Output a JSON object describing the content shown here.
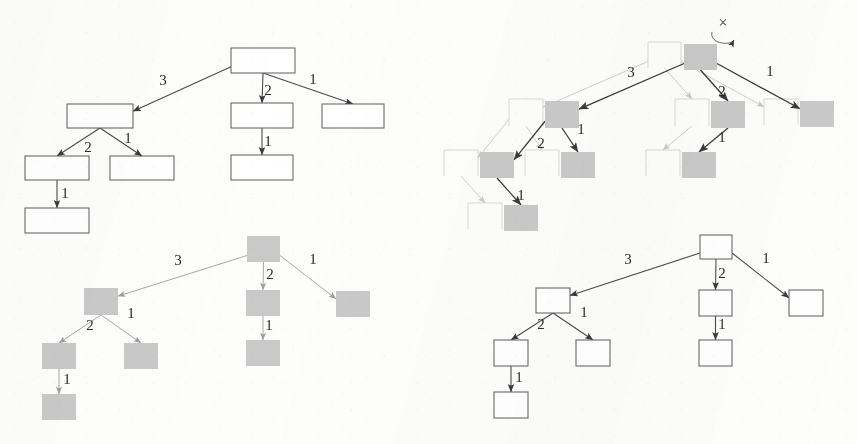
{
  "figure": {
    "kind": "tree-diagram-figure",
    "panel_count": 4,
    "background_color": "#fdfdfb",
    "outline_color": "#5d5d5d",
    "fill_gray": "#c9c9c9",
    "edge_color": "#4a4a4a"
  },
  "panels": [
    {
      "id": "top-left",
      "name": "panel-top-left",
      "style": "outline",
      "nodes": [
        {
          "id": "n0",
          "label": "",
          "x": 231,
          "y": 48,
          "w": 64,
          "h": 25,
          "fill": "outline"
        },
        {
          "id": "n1",
          "label": "",
          "x": 67,
          "y": 104,
          "w": 66,
          "h": 24,
          "fill": "outline"
        },
        {
          "id": "n2",
          "label": "",
          "x": 231,
          "y": 103,
          "w": 62,
          "h": 25,
          "fill": "outline"
        },
        {
          "id": "n3",
          "label": "",
          "x": 322,
          "y": 104,
          "w": 62,
          "h": 24,
          "fill": "outline"
        },
        {
          "id": "n4",
          "label": "",
          "x": 25,
          "y": 156,
          "w": 64,
          "h": 24,
          "fill": "outline"
        },
        {
          "id": "n5",
          "label": "",
          "x": 110,
          "y": 156,
          "w": 64,
          "h": 24,
          "fill": "outline"
        },
        {
          "id": "n6",
          "label": "",
          "x": 231,
          "y": 155,
          "w": 62,
          "h": 25,
          "fill": "outline"
        },
        {
          "id": "n7",
          "label": "",
          "x": 25,
          "y": 208,
          "w": 64,
          "h": 25,
          "fill": "outline"
        }
      ],
      "edges": [
        {
          "from": "n0",
          "to": "n1",
          "label": "3",
          "lx": 163,
          "ly": 85
        },
        {
          "from": "n0",
          "to": "n2",
          "label": "2",
          "lx": 268,
          "ly": 95
        },
        {
          "from": "n0",
          "to": "n3",
          "label": "1",
          "lx": 313,
          "ly": 84
        },
        {
          "from": "n1",
          "to": "n4",
          "label": "2",
          "lx": 88,
          "ly": 152
        },
        {
          "from": "n1",
          "to": "n5",
          "label": "1",
          "lx": 128,
          "ly": 143
        },
        {
          "from": "n2",
          "to": "n6",
          "label": "1",
          "lx": 268,
          "ly": 146
        },
        {
          "from": "n4",
          "to": "n7",
          "label": "1",
          "lx": 65,
          "ly": 198
        }
      ]
    },
    {
      "id": "top-right",
      "name": "panel-top-right",
      "style": "overlay-ghost-and-gray",
      "annotation": {
        "symbol": "×",
        "name": "cross-mark",
        "x": 723,
        "y": 28
      },
      "nodes": [
        {
          "id": "g0",
          "label": "",
          "x": 684,
          "y": 44,
          "w": 33,
          "h": 26,
          "fill": "gray"
        },
        {
          "id": "g1",
          "label": "",
          "x": 545,
          "y": 101,
          "w": 34,
          "h": 27,
          "fill": "gray"
        },
        {
          "id": "g2",
          "label": "",
          "x": 711,
          "y": 101,
          "w": 34,
          "h": 27,
          "fill": "gray"
        },
        {
          "id": "g3",
          "label": "",
          "x": 800,
          "y": 101,
          "w": 34,
          "h": 26,
          "fill": "gray"
        },
        {
          "id": "g4",
          "label": "",
          "x": 480,
          "y": 152,
          "w": 34,
          "h": 26,
          "fill": "gray"
        },
        {
          "id": "g5",
          "label": "",
          "x": 561,
          "y": 152,
          "w": 34,
          "h": 26,
          "fill": "gray"
        },
        {
          "id": "g6",
          "label": "",
          "x": 682,
          "y": 152,
          "w": 34,
          "h": 26,
          "fill": "gray"
        },
        {
          "id": "g7",
          "label": "",
          "x": 504,
          "y": 205,
          "w": 34,
          "h": 26,
          "fill": "gray"
        }
      ],
      "edges": [
        {
          "from": "g0",
          "to": "g1",
          "label": "3",
          "lx": 631,
          "ly": 77
        },
        {
          "from": "g0",
          "to": "g2",
          "label": "2",
          "lx": 722,
          "ly": 96
        },
        {
          "from": "g0",
          "to": "g3",
          "label": "1",
          "lx": 770,
          "ly": 76
        },
        {
          "from": "g1",
          "to": "g4",
          "label": "2",
          "lx": 541,
          "ly": 148
        },
        {
          "from": "g1",
          "to": "g5",
          "label": "1",
          "lx": 581,
          "ly": 134
        },
        {
          "from": "g2",
          "to": "g6",
          "label": "1",
          "lx": 722,
          "ly": 142
        },
        {
          "from": "g4",
          "to": "g7",
          "label": "1",
          "lx": 521,
          "ly": 200
        }
      ]
    },
    {
      "id": "bottom-left",
      "name": "panel-bottom-left",
      "style": "gray",
      "nodes": [
        {
          "id": "b0",
          "label": "",
          "x": 247,
          "y": 236,
          "w": 33,
          "h": 26,
          "fill": "gray"
        },
        {
          "id": "b1",
          "label": "",
          "x": 84,
          "y": 288,
          "w": 34,
          "h": 27,
          "fill": "gray"
        },
        {
          "id": "b2",
          "label": "",
          "x": 246,
          "y": 290,
          "w": 34,
          "h": 26,
          "fill": "gray"
        },
        {
          "id": "b3",
          "label": "",
          "x": 336,
          "y": 291,
          "w": 34,
          "h": 26,
          "fill": "gray"
        },
        {
          "id": "b4",
          "label": "",
          "x": 42,
          "y": 343,
          "w": 34,
          "h": 26,
          "fill": "gray"
        },
        {
          "id": "b5",
          "label": "",
          "x": 124,
          "y": 343,
          "w": 34,
          "h": 26,
          "fill": "gray"
        },
        {
          "id": "b6",
          "label": "",
          "x": 246,
          "y": 340,
          "w": 34,
          "h": 26,
          "fill": "gray"
        },
        {
          "id": "b7",
          "label": "",
          "x": 42,
          "y": 394,
          "w": 34,
          "h": 26,
          "fill": "gray"
        }
      ],
      "edges": [
        {
          "from": "b0",
          "to": "b1",
          "label": "3",
          "lx": 178,
          "ly": 265
        },
        {
          "from": "b0",
          "to": "b2",
          "label": "2",
          "lx": 270,
          "ly": 279
        },
        {
          "from": "b0",
          "to": "b3",
          "label": "1",
          "lx": 313,
          "ly": 264
        },
        {
          "from": "b1",
          "to": "b4",
          "label": "2",
          "lx": 90,
          "ly": 330
        },
        {
          "from": "b1",
          "to": "b5",
          "label": "1",
          "lx": 131,
          "ly": 318
        },
        {
          "from": "b2",
          "to": "b6",
          "label": "1",
          "lx": 269,
          "ly": 330
        },
        {
          "from": "b4",
          "to": "b7",
          "label": "1",
          "lx": 67,
          "ly": 384
        }
      ]
    },
    {
      "id": "bottom-right",
      "name": "panel-bottom-right",
      "style": "outline",
      "nodes": [
        {
          "id": "c0",
          "label": "",
          "x": 700,
          "y": 235,
          "w": 32,
          "h": 24,
          "fill": "outline"
        },
        {
          "id": "c1",
          "label": "",
          "x": 536,
          "y": 288,
          "w": 34,
          "h": 25,
          "fill": "outline"
        },
        {
          "id": "c2",
          "label": "",
          "x": 699,
          "y": 290,
          "w": 33,
          "h": 26,
          "fill": "outline"
        },
        {
          "id": "c3",
          "label": "",
          "x": 789,
          "y": 290,
          "w": 34,
          "h": 26,
          "fill": "outline"
        },
        {
          "id": "c4",
          "label": "",
          "x": 494,
          "y": 340,
          "w": 34,
          "h": 26,
          "fill": "outline"
        },
        {
          "id": "c5",
          "label": "",
          "x": 576,
          "y": 340,
          "w": 34,
          "h": 26,
          "fill": "outline"
        },
        {
          "id": "c6",
          "label": "",
          "x": 699,
          "y": 340,
          "w": 33,
          "h": 26,
          "fill": "outline"
        },
        {
          "id": "c7",
          "label": "",
          "x": 494,
          "y": 392,
          "w": 34,
          "h": 26,
          "fill": "outline"
        }
      ],
      "edges": [
        {
          "from": "c0",
          "to": "c1",
          "label": "3",
          "lx": 628,
          "ly": 264
        },
        {
          "from": "c0",
          "to": "c2",
          "label": "2",
          "lx": 722,
          "ly": 278
        },
        {
          "from": "c0",
          "to": "c3",
          "label": "1",
          "lx": 766,
          "ly": 263
        },
        {
          "from": "c1",
          "to": "c4",
          "label": "2",
          "lx": 541,
          "ly": 329
        },
        {
          "from": "c1",
          "to": "c5",
          "label": "1",
          "lx": 584,
          "ly": 317
        },
        {
          "from": "c2",
          "to": "c6",
          "label": "1",
          "lx": 722,
          "ly": 329
        },
        {
          "from": "c4",
          "to": "c7",
          "label": "1",
          "lx": 519,
          "ly": 382
        }
      ]
    }
  ]
}
